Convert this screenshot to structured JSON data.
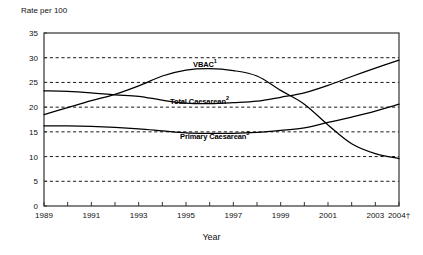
{
  "chart_data": {
    "type": "line",
    "title": "",
    "ylabel": "Rate per 100",
    "xlabel": "Year",
    "ylim": [
      0,
      35
    ],
    "ytick_step": 5,
    "yticks": [
      "0",
      "5",
      "10",
      "15",
      "20",
      "25",
      "30",
      "35"
    ],
    "grid": "horizontal-dashed",
    "legend": "inline-labels",
    "xlim": [
      1989,
      2004
    ],
    "x": [
      1989,
      1990,
      1991,
      1992,
      1993,
      1994,
      1995,
      1996,
      1997,
      1998,
      1999,
      2000,
      2001,
      2002,
      2003,
      2004
    ],
    "xtick_labels": [
      "1989",
      "1991",
      "1993",
      "1995",
      "1997",
      "1999",
      "2001",
      "2003",
      "2004†"
    ],
    "xtick_values": [
      1989,
      1991,
      1993,
      1995,
      1997,
      1999,
      2001,
      2003,
      2004
    ],
    "series": [
      {
        "name": "VBAC",
        "label": "VBAC",
        "superscript": "1",
        "color": "#000000",
        "values": [
          18.5,
          19.9,
          21.3,
          22.6,
          24.3,
          26.3,
          27.5,
          27.8,
          27.4,
          26.3,
          23.4,
          20.6,
          16.4,
          12.6,
          10.6,
          9.6
        ]
      },
      {
        "name": "Total Caesarean",
        "label": "Total Caesarean",
        "superscript": "2",
        "color": "#000000",
        "values": [
          23.3,
          23.2,
          22.9,
          22.5,
          22.2,
          21.4,
          20.8,
          20.7,
          20.9,
          21.2,
          22.0,
          22.9,
          24.4,
          26.2,
          27.9,
          29.5
        ]
      },
      {
        "name": "Primary Caesarean",
        "label": "Primary Caesarean",
        "superscript": "3",
        "color": "#000000",
        "values": [
          16.2,
          16.2,
          16.1,
          15.9,
          15.6,
          15.2,
          14.8,
          14.7,
          14.7,
          14.9,
          15.3,
          15.8,
          16.9,
          18.0,
          19.2,
          20.6
        ]
      }
    ]
  }
}
